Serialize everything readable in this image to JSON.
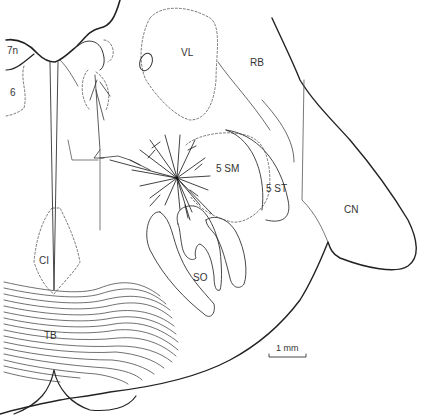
{
  "figure": {
    "type": "neuroanatomical line drawing",
    "background": "#ffffff",
    "line_color": "#222222",
    "labels": [
      {
        "id": "7n",
        "text": "7n",
        "x": 7,
        "y": 46
      },
      {
        "id": "6",
        "text": "6",
        "x": 10,
        "y": 88
      },
      {
        "id": "VL",
        "text": "VL",
        "x": 181,
        "y": 48
      },
      {
        "id": "RB",
        "text": "RB",
        "x": 250,
        "y": 58
      },
      {
        "id": "5SM",
        "text": "5 SM",
        "x": 216,
        "y": 164
      },
      {
        "id": "5ST",
        "text": "5 ST",
        "x": 266,
        "y": 184
      },
      {
        "id": "CN",
        "text": "CN",
        "x": 344,
        "y": 205
      },
      {
        "id": "CI",
        "text": "CI",
        "x": 39,
        "y": 256
      },
      {
        "id": "SO",
        "text": "SO",
        "x": 193,
        "y": 273
      },
      {
        "id": "TB",
        "text": "TB",
        "x": 44,
        "y": 331
      }
    ],
    "scale_bar": {
      "label": "1 mm",
      "x1": 269,
      "x2": 306,
      "y": 356
    }
  }
}
